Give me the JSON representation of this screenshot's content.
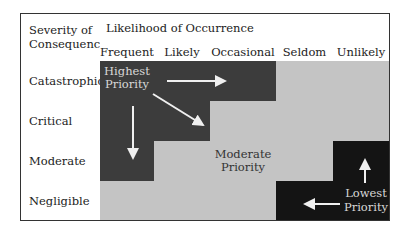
{
  "matrix": {
    "corner_label_line1": "Severity of",
    "corner_label_line2": "Consequences",
    "likelihood_title": "Likelihood of Occurrence",
    "columns": [
      "Frequent",
      "Likely",
      "Occasional",
      "Seldom",
      "Unlikely"
    ],
    "rows": [
      "Catastrophic",
      "Critical",
      "Moderate",
      "Negligible"
    ],
    "cell_levels": [
      [
        "high",
        "high",
        "high",
        "moderate",
        "moderate"
      ],
      [
        "high",
        "high",
        "moderate",
        "moderate",
        "moderate"
      ],
      [
        "high",
        "moderate",
        "moderate",
        "moderate",
        "low"
      ],
      [
        "moderate",
        "moderate",
        "moderate",
        "low",
        "low"
      ]
    ],
    "annotations": {
      "highest_line1": "Highest",
      "highest_line2": "Priority",
      "moderate_line1": "Moderate",
      "moderate_line2": "Priority",
      "lowest_line1": "Lowest",
      "lowest_line2": "Priority"
    },
    "colors": {
      "high": "#3c3c3c",
      "moderate": "#c4c4c4",
      "low": "#141414",
      "border": "#333333",
      "arrow": "#f0f0f0"
    }
  }
}
